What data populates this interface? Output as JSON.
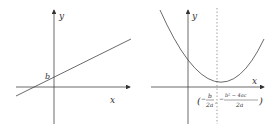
{
  "left_graph": {
    "type": "linear",
    "y_axis_label": "y",
    "x_axis_label": "x",
    "intercept_label": "b"
  },
  "right_graph": {
    "type": "parabola",
    "y_axis_label": "y",
    "x_axis_label": "x",
    "vertex_label": "(−b/2a, −(b²−4ac)/2a)",
    "vertex_x_num": "b",
    "vertex_x_den": "2a",
    "vertex_y_num": "b² − 4ac",
    "vertex_y_den": "2a"
  },
  "colors": {
    "stroke": "#444444",
    "dashed": "#888888"
  }
}
